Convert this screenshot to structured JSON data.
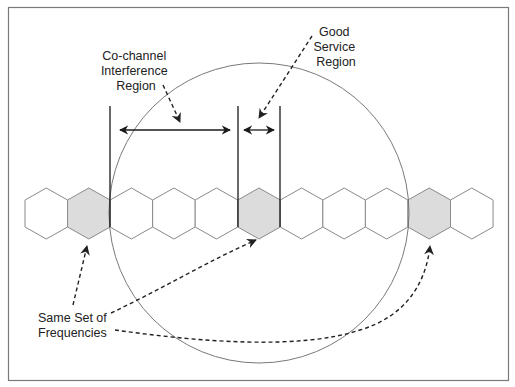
{
  "diagram": {
    "labels": {
      "cochannel": [
        "Co-channel",
        "Interference",
        "Region"
      ],
      "good_service": [
        "Good",
        "Service",
        "Region"
      ],
      "same_set": [
        "Same Set of",
        "Frequencies"
      ]
    },
    "cells": {
      "count": 11,
      "shaded_indices": [
        1,
        5,
        9
      ],
      "shaded_meaning": "Same Set of Frequencies"
    },
    "colors": {
      "border": "#7a7a7a",
      "hex_stroke": "#8a8a8a",
      "hex_shaded_fill": "#dcdcdc",
      "hex_fill": "#ffffff",
      "line": "#1a1a1a",
      "circle": "#6a6a6a",
      "dashed": "#333333"
    }
  }
}
